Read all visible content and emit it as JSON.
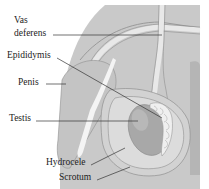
{
  "figure": {
    "labels": {
      "vas_deferens_line1": "Vas",
      "vas_deferens_line2": "deferens",
      "epididymis": "Epididymis",
      "penis": "Penis",
      "testis": "Testis",
      "hydrocele": "Hydrocele",
      "scrotum": "Scrotum"
    },
    "colors": {
      "body_fill": "#c9c9c9",
      "body_dark": "#b5b5b5",
      "tube_fill": "#e8e8e8",
      "scrotum_fill": "#d2d2d2",
      "hydrocele_fill": "#dcdcdc",
      "testis_fill": "#a8a8a8",
      "epididymis_fill": "#efefef",
      "outline": "#8f8f8f",
      "label_text": "#222222",
      "leader_line": "#333333"
    }
  }
}
